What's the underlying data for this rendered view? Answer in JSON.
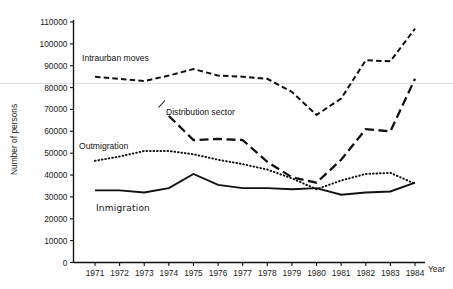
{
  "chart_data": {
    "type": "line",
    "title": "",
    "xlabel": "Year",
    "ylabel": "Number of persons",
    "x": [
      1971,
      1972,
      1973,
      1974,
      1975,
      1976,
      1977,
      1978,
      1979,
      1980,
      1981,
      1982,
      1983,
      1984
    ],
    "categories": [
      "1971",
      "1972",
      "1973",
      "1974",
      "1975",
      "1976",
      "1977",
      "1978",
      "1979",
      "1980",
      "1981",
      "1982",
      "1983",
      "1984"
    ],
    "xlim": [
      1971,
      1984
    ],
    "ylim": [
      0,
      110000
    ],
    "yticks": [
      0,
      10000,
      20000,
      30000,
      40000,
      50000,
      60000,
      70000,
      80000,
      90000,
      100000,
      110000
    ],
    "ytick_labels": [
      "0",
      "10000",
      "20000",
      "30000",
      "40000",
      "50000",
      "60000",
      "70000",
      "80000",
      "90000",
      "100000",
      "110000"
    ],
    "grid": false,
    "legend_position": "inline-annotations",
    "series": [
      {
        "name": "Intraurban moves",
        "style": "short-dashed",
        "label_x": 1972.0,
        "label_y": 90500,
        "values": [
          85000,
          84000,
          83000,
          85500,
          88500,
          85500,
          85000,
          84000,
          78000,
          67500,
          75000,
          92500,
          92000,
          107000
        ]
      },
      {
        "name": "Distribution sector",
        "style": "long-dashed",
        "label_x": 1975.3,
        "label_y": 66500,
        "values": [
          null,
          null,
          null,
          67000,
          56000,
          56500,
          56000,
          46000,
          39000,
          36500,
          47000,
          61000,
          60000,
          84000
        ]
      },
      {
        "name": "Outmigration",
        "style": "dotted",
        "label_x": 1971.3,
        "label_y": 50500,
        "values": [
          46500,
          48500,
          51000,
          51000,
          49500,
          47000,
          45000,
          42500,
          38500,
          33500,
          37500,
          40500,
          41000,
          36000
        ]
      },
      {
        "name": "Inmigration",
        "style": "solid",
        "label_x": 1972.3,
        "label_y": 27000,
        "values": [
          33000,
          33000,
          32000,
          34000,
          40500,
          35500,
          34000,
          34000,
          33500,
          34000,
          31000,
          32000,
          32500,
          36500
        ]
      }
    ]
  },
  "axes": {
    "y_axis_title": "Number of persons",
    "x_axis_title": "Year",
    "y_ticks": [
      "110000",
      "100000",
      "90000",
      "80000",
      "70000",
      "60000",
      "50000",
      "40000",
      "30000",
      "20000",
      "10000",
      "0"
    ],
    "x_ticks": [
      "1971",
      "1972",
      "1973",
      "1974",
      "1975",
      "1976",
      "1977",
      "1978",
      "1979",
      "1980",
      "1981",
      "1982",
      "1983",
      "1984"
    ]
  },
  "annotations": {
    "intraurban": "Intraurban moves",
    "distribution": "Distribution sector",
    "outmigration": "Outmigration",
    "inmigration": "Inmigration"
  }
}
